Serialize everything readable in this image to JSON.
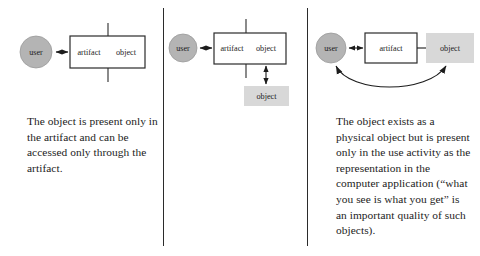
{
  "figure": {
    "type": "diagram",
    "background": "#ffffff",
    "panel_count": 3,
    "divider_color": "#2b2b2b"
  },
  "colors": {
    "user_circle_fill": "#b4b4b4",
    "user_circle_stroke": "#9a9a9a",
    "object_gray_fill": "#d8d8d8",
    "box_stroke": "#2b2b2b",
    "arrow_color": "#1c1c1c",
    "text_color": "#1c1c1c"
  },
  "panels": [
    {
      "id": "panel-1",
      "nodes": {
        "user": "user",
        "artifact": "artifact",
        "object": "object"
      },
      "caption": "The object is present only in the artifact and can be accessed only through the artifact."
    },
    {
      "id": "panel-2",
      "nodes": {
        "user": "user",
        "artifact": "artifact",
        "object": "object",
        "physical_object": "object"
      },
      "caption": "The object exists as a physical object but is present only in the use activity as the representation in the computer application (“what you see is what you get” is an important quality of such objects)."
    },
    {
      "id": "panel-3",
      "nodes": {
        "user": "user",
        "artifact": "artifact",
        "object": "object"
      },
      "caption": "The object is physically co-present outside the artifact, and any interaction with the artifact has consequences to be inspected on the object."
    }
  ]
}
